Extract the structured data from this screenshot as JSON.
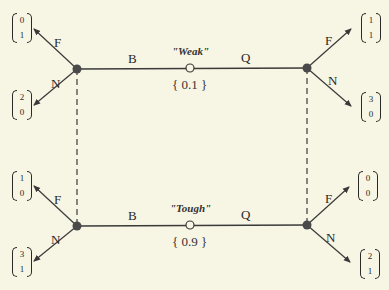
{
  "colors": {
    "background": "#f7f5e3",
    "line": "#3a3a3a",
    "node_fill": "#4a4a4a"
  },
  "nature_nodes": [
    {
      "type_label": "\"Weak\"",
      "probability": "{ 0.1 }"
    },
    {
      "type_label": "\"Tough\"",
      "probability": "{ 0.9 }"
    }
  ],
  "sender_actions": {
    "left": "B",
    "right": "Q"
  },
  "receiver_actions": {
    "fight": "F",
    "not_fight": "N"
  },
  "payoffs": {
    "weak_beer_fight": [
      "0",
      "1"
    ],
    "weak_beer_not": [
      "2",
      "0"
    ],
    "weak_quiche_fight": [
      "1",
      "1"
    ],
    "weak_quiche_not": [
      "3",
      "0"
    ],
    "tough_beer_fight": [
      "1",
      "0"
    ],
    "tough_beer_not": [
      "3",
      "1"
    ],
    "tough_quiche_fight": [
      "0",
      "0"
    ],
    "tough_quiche_not": [
      "2",
      "1"
    ]
  }
}
